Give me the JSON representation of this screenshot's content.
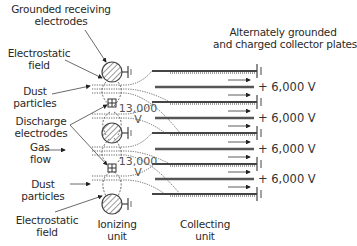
{
  "diagram": {
    "labels": {
      "grounded_receiving": [
        "Grounded receiving",
        "electrodes"
      ],
      "electrostatic_field_top": [
        "Electrostatic",
        "field"
      ],
      "dust_particles_top": [
        "Dust",
        "particles"
      ],
      "discharge_electrodes": [
        "Discharge",
        "electrodes"
      ],
      "gas_flow": [
        "Gas",
        "flow"
      ],
      "dust_particles_bottom": [
        "Dust",
        "particles"
      ],
      "electrostatic_field_bottom": [
        "Electrostatic",
        "field"
      ],
      "ionizing_unit": [
        "Ionizing",
        "unit"
      ],
      "collecting_unit": [
        "Collecting",
        "unit"
      ],
      "collector_plates": [
        "Alternately grounded",
        "and charged collector plates"
      ]
    },
    "discharge_voltage": [
      "13,000",
      "V"
    ],
    "charged_plate_voltages": [
      "+ 6,000 V",
      "+ 6,000 V",
      "+ 6,000 V",
      "+ 6,000 V"
    ],
    "colors": {
      "line": "#444444",
      "hatch": "#555555",
      "arrow": "#222222"
    }
  }
}
